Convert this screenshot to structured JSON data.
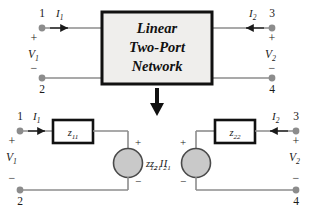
{
  "figure": {
    "colors": {
      "wire": "#8c8c8c",
      "node_dot": "#8c8c8c",
      "box_fill": "#efeeec",
      "box_stroke": "#111111",
      "source_fill": "#c9c9c9",
      "source_stroke": "#4a4a4a",
      "text": "#1a1a1a",
      "arrow": "#111111",
      "background": "#ffffff"
    }
  },
  "top_block": {
    "box_label_line1": "Linear",
    "box_label_line2": "Two-Port",
    "box_label_line3": "Network",
    "left_port": {
      "terminal_top": "1",
      "terminal_bottom": "2",
      "current": "I",
      "current_sub": "1",
      "voltage": "V",
      "voltage_sub": "1",
      "plus": "+",
      "minus": "−"
    },
    "right_port": {
      "terminal_top": "3",
      "terminal_bottom": "4",
      "current": "I",
      "current_sub": "2",
      "voltage": "V",
      "voltage_sub": "2",
      "plus": "+",
      "minus": "−"
    }
  },
  "transition_arrow": {
    "direction": "down",
    "name": "equivalent-circuit-arrow"
  },
  "equivalent_circuit": {
    "left_mesh": {
      "terminal_top": "1",
      "terminal_bottom": "2",
      "current": "I",
      "current_sub": "1",
      "voltage": "V",
      "voltage_sub": "1",
      "plus": "+",
      "minus": "−",
      "impedance": "z",
      "impedance_sub": "11",
      "source_label": "z",
      "source_label_sub": "12",
      "source_current": "I",
      "source_current_sub": "2",
      "source_plus": "+",
      "source_minus": "−"
    },
    "right_mesh": {
      "terminal_top": "3",
      "terminal_bottom": "4",
      "current": "I",
      "current_sub": "2",
      "voltage": "V",
      "voltage_sub": "2",
      "plus": "+",
      "minus": "−",
      "impedance": "z",
      "impedance_sub": "22",
      "source_label": "z",
      "source_label_sub": "21",
      "source_current": "I",
      "source_current_sub": "1",
      "source_plus": "+",
      "source_minus": "−"
    }
  }
}
